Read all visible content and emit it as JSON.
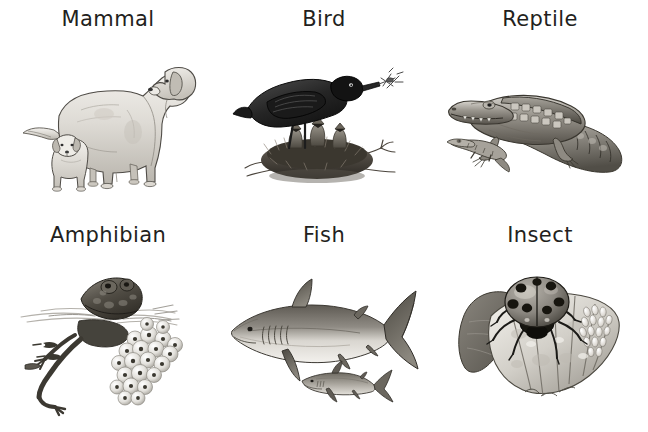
{
  "poster": {
    "title": "Animal Groups",
    "background_color": "#ffffff",
    "text_color": "#231f20",
    "columns": 3,
    "rows": 2
  },
  "cells": [
    {
      "label": "Mammal",
      "illustration": "adult-dog-with-puppy",
      "illustration_description": "Grayscale pencil drawing of an adult retriever dog standing, with a small puppy standing beside its front legs.",
      "subjects": [
        "adult dog",
        "puppy"
      ]
    },
    {
      "label": "Bird",
      "illustration": "blackbird-with-chicks-in-nest",
      "illustration_description": "Grayscale pencil drawing of a blackbird perched on a twig nest holding an insect in its beak, with three open-mouthed chicks in the nest below.",
      "subjects": [
        "adult blackbird",
        "chicks",
        "nest"
      ]
    },
    {
      "label": "Reptile",
      "illustration": "crocodile-with-hatchling",
      "illustration_description": "Grayscale pencil drawing of an adult crocodile lying with its tail curled, and a small hatchling crocodile in front of it.",
      "subjects": [
        "adult crocodile",
        "hatchling"
      ]
    },
    {
      "label": "Amphibian",
      "illustration": "frog-with-frogspawn-and-tadpoles",
      "illustration_description": "Grayscale pencil drawing of a frog at the water surface with its legs trailing below, a cluster of frogspawn eggs and small tadpoles in the water.",
      "subjects": [
        "adult frog",
        "frogspawn",
        "tadpoles"
      ]
    },
    {
      "label": "Fish",
      "illustration": "shark-with-young-shark",
      "illustration_description": "Grayscale pencil drawing of a large shark swimming left, with a much smaller young shark below and behind it.",
      "subjects": [
        "adult shark",
        "young shark"
      ]
    },
    {
      "label": "Insect",
      "illustration": "ladybird-on-leaf-with-eggs",
      "illustration_description": "Grayscale pencil drawing of a spotted ladybird beetle standing on a leaf, with a cluster of pale eggs on the right side of the leaf.",
      "subjects": [
        "ladybird beetle",
        "eggs",
        "leaf"
      ]
    }
  ]
}
